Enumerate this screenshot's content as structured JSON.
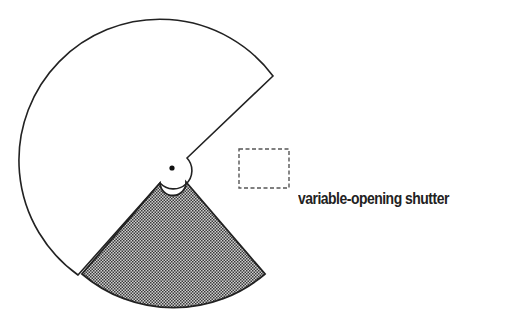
{
  "diagram": {
    "label": "variable-opening shutter",
    "colors": {
      "stroke": "#222222",
      "background": "#ffffff",
      "hatch_dark": "#3a3a3a",
      "hatch_light": "#d8d8d8",
      "dashed_box": "#555555"
    },
    "elements": {
      "rotating_disk": "open sector disk (white, ~270° opaque with cut-out opening)",
      "adjustable_blade": "shaded wedge overlapping lower section",
      "hub": "center pivot with dot",
      "aperture": "dashed rectangle (film gate / aperture)"
    }
  }
}
